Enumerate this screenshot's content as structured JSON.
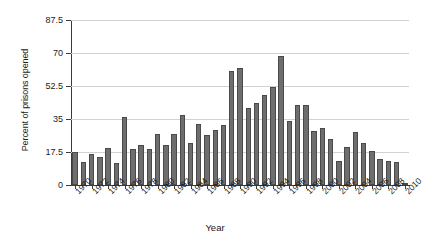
{
  "chart_data": {
    "type": "bar",
    "title": "",
    "xlabel": "Year",
    "ylabel": "Percent of prisons opened",
    "ylim": [
      0,
      87.5
    ],
    "yticks": [
      0,
      17.5,
      35,
      52.5,
      70,
      87.5
    ],
    "ytick_labels": [
      "0",
      "17.5",
      "35",
      "52.5",
      "70",
      "87.5"
    ],
    "grid": true,
    "legend": "none",
    "bar_color": "#6e6e6e",
    "bar_edge_color": "#4a4a4a",
    "xtick_labels": [
      "1970",
      "1972",
      "1974",
      "1976",
      "1978",
      "1980",
      "1982",
      "1984",
      "1986",
      "1988",
      "1990",
      "1992",
      "1994",
      "1996",
      "1998",
      "2000",
      "2002",
      "2004",
      "2006",
      "2008",
      "2010"
    ],
    "categories": [
      "1970",
      "1971",
      "1972",
      "1973",
      "1974",
      "1975",
      "1976",
      "1977",
      "1978",
      "1979",
      "1980",
      "1981",
      "1982",
      "1983",
      "1984",
      "1985",
      "1986",
      "1987",
      "1988",
      "1989",
      "1990",
      "1991",
      "1992",
      "1993",
      "1994",
      "1995",
      "1996",
      "1997",
      "1998",
      "1999",
      "2000",
      "2001",
      "2002",
      "2003",
      "2004",
      "2005",
      "2006",
      "2007",
      "2008",
      "2009",
      "2010"
    ],
    "values": [
      17.3,
      12.0,
      16.6,
      14.8,
      19.6,
      11.6,
      36.2,
      19.0,
      21.4,
      19.0,
      27.3,
      21.2,
      27.2,
      37.3,
      22.4,
      32.5,
      26.7,
      29.4,
      31.6,
      60.2,
      62.3,
      40.7,
      43.5,
      47.8,
      52.0,
      68.4,
      34.0,
      42.3,
      42.3,
      28.7,
      30.4,
      24.5,
      12.7,
      20.1,
      28.2,
      22.4,
      17.8,
      14.0,
      12.9,
      12.0,
      1.1
    ]
  }
}
